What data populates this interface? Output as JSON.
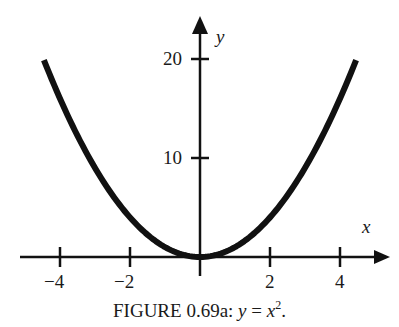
{
  "chart_data": {
    "type": "line",
    "function": "y = x^2",
    "xlabel": "x",
    "ylabel": "y",
    "xlim": [
      -4.46,
      4.46
    ],
    "ylim": [
      0,
      20
    ],
    "x_ticks": [
      -4,
      -2,
      2,
      4
    ],
    "x_tick_labels": [
      "−4",
      "−2",
      "2",
      "4"
    ],
    "y_ticks": [
      10,
      20
    ],
    "y_tick_labels": [
      "10",
      "20"
    ],
    "grid": false,
    "legend": null,
    "series": [
      {
        "name": "y = x^2",
        "x": [
          -4.46,
          -4,
          -3,
          -2,
          -1,
          0,
          1,
          2,
          3,
          4,
          4.46
        ],
        "y": [
          19.9,
          16,
          9,
          4,
          1,
          0,
          1,
          4,
          9,
          16,
          19.9
        ]
      }
    ]
  },
  "axes": {
    "x_label": "x",
    "y_label": "y",
    "x_tick_labels": [
      "−4",
      "−2",
      "2",
      "4"
    ],
    "y_tick_labels": [
      "10",
      "20"
    ]
  },
  "caption": {
    "prefix": "FIGURE 0.69a: ",
    "equation_lhs": "y",
    "equals": " = ",
    "equation_rhs": "x",
    "exponent": "2",
    "suffix": "."
  },
  "colors": {
    "curve": "#111111",
    "axes": "#111111",
    "text": "#1a1a1a",
    "background": "#ffffff"
  }
}
